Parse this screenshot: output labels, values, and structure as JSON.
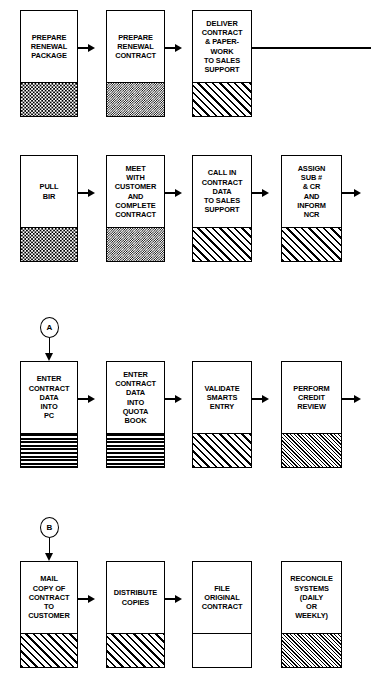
{
  "diagram": {
    "line_color": "#000000",
    "background_color": "#ffffff"
  },
  "rows": [
    {
      "id": "row-1",
      "boxes": [
        {
          "id": "prepare-renewal-package",
          "label": "PREPARE\nRENEWAL\nPACKAGE",
          "fill": "stipple"
        },
        {
          "id": "prepare-renewal-contract",
          "label": "PREPARE\nRENEWAL\nCONTRACT",
          "fill": "check"
        },
        {
          "id": "deliver-contract-paperwork",
          "label": "DELIVER\nCONTRACT\n& PAPER-\nWORK\nTO SALES\nSUPPORT",
          "fill": "diag-coarse"
        }
      ]
    },
    {
      "id": "row-2",
      "boxes": [
        {
          "id": "pull-bir",
          "label": "PULL\nBIR",
          "fill": "stipple"
        },
        {
          "id": "meet-with-customer",
          "label": "MEET\nWITH\nCUSTOMER\nAND\nCOMPLETE\nCONTRACT",
          "fill": "check"
        },
        {
          "id": "call-in-contract-data",
          "label": "CALL IN\nCONTRACT\nDATA\nTO SALES\nSUPPORT",
          "fill": "diag-coarse"
        },
        {
          "id": "assign-sub-cr-inform-ncr",
          "label": "ASSIGN\nSUB #\n& CR\nAND\nINFORM\nNCR",
          "fill": "diag-coarse"
        }
      ]
    },
    {
      "id": "row-3",
      "connector": "A",
      "boxes": [
        {
          "id": "enter-contract-data-into-pc",
          "label": "ENTER\nCONTRACT\nDATA\nINTO\nPC",
          "fill": "hlines"
        },
        {
          "id": "enter-contract-data-into-quota-book",
          "label": "ENTER\nCONTRACT\nDATA\nINTO\nQUOTA\nBOOK",
          "fill": "hlines"
        },
        {
          "id": "validate-smarts-entry",
          "label": "VALIDATE\nSMARTS\nENTRY",
          "fill": "diag-coarse"
        },
        {
          "id": "perform-credit-review",
          "label": "PERFORM\nCREDIT\nREVIEW",
          "fill": "diag-fine"
        }
      ]
    },
    {
      "id": "row-4",
      "connector": "B",
      "boxes": [
        {
          "id": "mail-copy-of-contract-to-customer",
          "label": "MAIL\nCOPY OF\nCONTRACT\nTO\nCUSTOMER",
          "fill": "diag-coarse"
        },
        {
          "id": "distribute-copies",
          "label": "DISTRIBUTE\nCOPIES",
          "fill": "diag-coarse"
        },
        {
          "id": "file-original-contract",
          "label": "FILE\nORIGINAL\nCONTRACT",
          "fill": "none"
        },
        {
          "id": "reconcile-systems",
          "label": "RECONCILE\nSYSTEMS\n(DAILY\nOR\nWEEKLY)",
          "fill": "diag-fine"
        }
      ]
    }
  ],
  "connectors": {
    "a_label": "A",
    "b_label": "B"
  }
}
